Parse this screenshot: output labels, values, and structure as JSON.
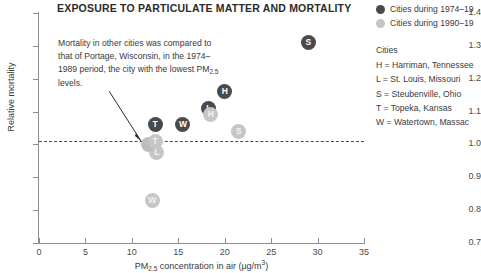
{
  "title": "EXPOSURE TO PARTICULATE MATTER AND MORTALITY",
  "annotation": "Mortality in other cities was compared to that of Portage, Wisconsin, in the 1974–1989 period, the city with the lowest PM2.5 levels.",
  "axes": {
    "x_label_prefix": "PM",
    "x_label_sub": "2.5",
    "x_label_suffix": " concentration in air (μg/m",
    "x_label_sup": "3",
    "x_label_end": ")",
    "y_label": "Relative mortality",
    "x_ticks": [
      "0",
      "5",
      "10",
      "15",
      "20",
      "25",
      "30",
      "35"
    ],
    "y_ticks": [
      "1.4",
      "1.3",
      "1.2",
      "1.1",
      "1.0",
      "0.9",
      "0.8",
      "0.7"
    ]
  },
  "legend": {
    "series": [
      {
        "label": "Cities during 1974–19",
        "color": "#4a4a4a",
        "name": "period-early"
      },
      {
        "label": "Cities during 1990–19",
        "color": "#c6c6c6",
        "name": "period-late"
      }
    ],
    "cities_heading": "Cities",
    "cities": [
      "H = Harriman, Tennessee",
      "L = St. Louis, Missouri",
      "S = Steubenville, Ohio",
      "T = Topeka, Kansas",
      "W = Watertown, Massac"
    ]
  },
  "chart_data": {
    "type": "scatter",
    "title": "EXPOSURE TO PARTICULATE MATTER AND MORTALITY",
    "xlabel": "PM2.5 concentration in air (μg/m3)",
    "ylabel": "Relative mortality",
    "xlim": [
      0,
      35
    ],
    "ylim": [
      0.7,
      1.4
    ],
    "grid": false,
    "legend_position": "right",
    "reference_line": {
      "y": 1.0,
      "style": "dashed",
      "label": "Portage, Wisconsin baseline"
    },
    "series": [
      {
        "name": "Cities during 1974–1989",
        "color": "#4a4a4a",
        "points": [
          {
            "label": "T",
            "city": "Topeka, Kansas",
            "x": 12.5,
            "y": 1.06
          },
          {
            "label": "W",
            "city": "Watertown, Massachusetts",
            "x": 15.5,
            "y": 1.06
          },
          {
            "label": "L",
            "city": "St. Louis, Missouri",
            "x": 18.3,
            "y": 1.11
          },
          {
            "label": "H",
            "city": "Harriman, Tennessee",
            "x": 20.0,
            "y": 1.16
          },
          {
            "label": "S",
            "city": "Steubenville, Ohio",
            "x": 29.0,
            "y": 1.31
          }
        ]
      },
      {
        "name": "Cities during 1990–2000",
        "color": "#c6c6c6",
        "points": [
          {
            "label": "W",
            "city": "Watertown, Massachusetts",
            "x": 12.2,
            "y": 0.83
          },
          {
            "label": "L",
            "city": "St. Louis, Missouri",
            "x": 12.7,
            "y": 0.975
          },
          {
            "label": "P",
            "city": "Portage, Wisconsin",
            "x": 11.8,
            "y": 1.0
          },
          {
            "label": "T",
            "city": "Topeka, Kansas",
            "x": 12.5,
            "y": 1.01
          },
          {
            "label": "S",
            "city": "Steubenville, Ohio",
            "x": 21.5,
            "y": 1.04
          },
          {
            "label": "H",
            "city": "Harriman, Tennessee",
            "x": 18.5,
            "y": 1.09
          }
        ]
      }
    ]
  }
}
